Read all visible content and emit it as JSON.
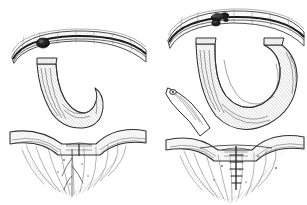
{
  "figure": {
    "kind": "pen-and-ink surgical illustration",
    "medium": "engraving / hatched line drawing",
    "background_color": "#ffffff",
    "ink_color": "#2b2b2b",
    "tone_color": "#6f6f6f",
    "canvas": {
      "width": 307,
      "height": 205
    },
    "panel_count": 2,
    "panels": [
      {
        "id": "panel-left",
        "position": "left",
        "caption": "",
        "bounds": {
          "x": 8,
          "y": 22,
          "width": 142,
          "height": 175
        },
        "description": "Short pedunculated loop descending from an arched band, dark lesion on the band, transverse vessel and radiating mesentery below",
        "parts": [
          {
            "name": "arched-band",
            "label": "",
            "dark_line": true
          },
          {
            "name": "lesion-spot",
            "label": "",
            "cx": 43,
            "cy": 43,
            "rx": 6.5,
            "ry": 5
          },
          {
            "name": "pedicle-stalk",
            "label": ""
          },
          {
            "name": "descending-loop",
            "label": ""
          },
          {
            "name": "transverse-vessel",
            "label": ""
          },
          {
            "name": "mesentery-fan",
            "label": ""
          }
        ]
      },
      {
        "id": "panel-right",
        "position": "right",
        "caption": "",
        "bounds": {
          "x": 160,
          "y": 2,
          "width": 145,
          "height": 200
        },
        "description": "Elongated redundant loop doubled back beneath the arched band, irregular dark lesion above, lateral stump at left, sutured transverse vessel below",
        "parts": [
          {
            "name": "arched-band",
            "label": "",
            "dark_line": true
          },
          {
            "name": "lesion-spot",
            "label": "",
            "cx": 218,
            "cy": 18,
            "rx": 9,
            "ry": 6
          },
          {
            "name": "long-loop",
            "label": ""
          },
          {
            "name": "lateral-stump",
            "label": ""
          },
          {
            "name": "transverse-vessel",
            "label": ""
          },
          {
            "name": "suture-line",
            "label": ""
          },
          {
            "name": "mesentery-fan",
            "label": ""
          }
        ]
      }
    ]
  }
}
